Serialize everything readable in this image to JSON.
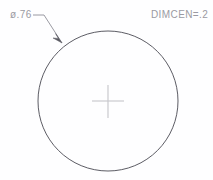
{
  "drawing": {
    "title": "Circle with center mark and diameter leader",
    "background_color": "#fefeff",
    "annotations": {
      "diameter_label": "ø.76",
      "dimcen_label": "DIMCEN=.2"
    },
    "geometry": {
      "circle": {
        "center_x": 108,
        "center_y": 101,
        "radius": 70,
        "stroke_color": "#4a4a52",
        "stroke_width": 0.9
      },
      "center_mark": {
        "stroke_color": "#c9c9ce",
        "stroke_width": 1.2,
        "horizontal_x1": 92,
        "horizontal_x2": 124,
        "horizontal_y": 101,
        "vertical_y1": 85,
        "vertical_y2": 118,
        "vertical_x": 108,
        "size_value": ".2"
      },
      "leader": {
        "stroke_color": "#8f8f97",
        "stroke_width": 0.9,
        "landing_x1": 33,
        "landing_x2": 44,
        "landing_y": 15,
        "tip_x": 62,
        "tip_y": 43
      }
    }
  }
}
